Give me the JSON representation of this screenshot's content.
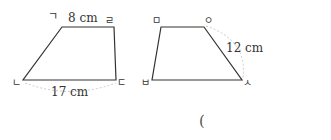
{
  "figures": [
    {
      "name": "trapezoid-1",
      "vertices": {
        "top_left": "ㄱ",
        "top_right": "ㄹ",
        "bottom_right": "ㄷ",
        "bottom_left": "ㄴ"
      },
      "top_length": "8 cm",
      "bottom_length": "17 cm"
    },
    {
      "name": "trapezoid-2",
      "vertices": {
        "top_left": "ㅁ",
        "top_right": "ㅇ",
        "bottom_right": "ㅅ",
        "bottom_left": "ㅂ"
      },
      "side_length": "12 cm"
    }
  ],
  "answer": {
    "open_paren": "("
  }
}
